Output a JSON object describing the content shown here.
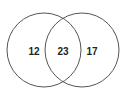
{
  "diagram": {
    "type": "venn",
    "sets": [
      {
        "name": "left",
        "cx": 44,
        "cy": 50,
        "r": 37
      },
      {
        "name": "right",
        "cx": 82,
        "cy": 50,
        "r": 37
      }
    ],
    "regions": {
      "left_only": "12",
      "intersection": "23",
      "right_only": "17"
    },
    "colors": {
      "stroke": "#555555",
      "text": "#222222",
      "background": "#ffffff"
    }
  }
}
